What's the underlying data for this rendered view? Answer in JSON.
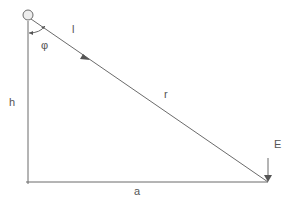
{
  "diagram": {
    "labels": {
      "length": "l",
      "angle": "φ",
      "height": "h",
      "distance": "r",
      "base": "a",
      "field": "E"
    },
    "colors": {
      "line": "#6b6b6b",
      "pivot_fill": "#eeeeee",
      "text": "#555555"
    }
  }
}
